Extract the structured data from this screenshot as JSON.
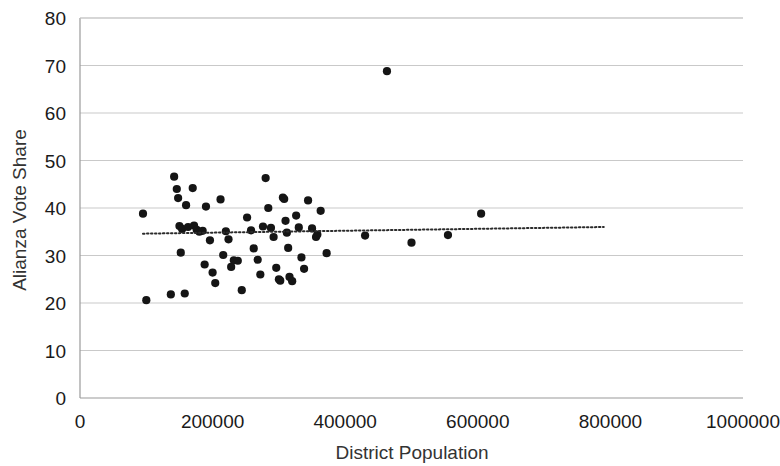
{
  "chart_data": {
    "type": "scatter",
    "title": "",
    "xlabel": "District Population",
    "ylabel": "Alianza Vote Share",
    "xlim": [
      0,
      1000000
    ],
    "ylim": [
      0,
      80
    ],
    "xticks": [
      0,
      200000,
      400000,
      600000,
      800000,
      1000000
    ],
    "xtick_labels": [
      "0",
      "200000",
      "400000",
      "600000",
      "800000",
      "1000000"
    ],
    "yticks": [
      0,
      10,
      20,
      30,
      40,
      50,
      60,
      70,
      80
    ],
    "ytick_labels": [
      "0",
      "10",
      "20",
      "30",
      "40",
      "50",
      "60",
      "70",
      "80"
    ],
    "grid": "horizontal",
    "legend": "none",
    "point_color": "#151515",
    "gridline_color": "#c9c9c9",
    "trendline": {
      "style": "dotted",
      "color": "#2b2b2b",
      "x_start": 95000,
      "y_start": 34.6,
      "x_end": 790000,
      "y_end": 36.0
    },
    "series": [
      {
        "name": "Districts",
        "points": [
          [
            95000,
            38.8
          ],
          [
            100000,
            20.6
          ],
          [
            137000,
            21.8
          ],
          [
            142000,
            46.6
          ],
          [
            146000,
            44.0
          ],
          [
            148000,
            42.1
          ],
          [
            150000,
            36.2
          ],
          [
            152000,
            30.6
          ],
          [
            154000,
            35.6
          ],
          [
            158000,
            22.0
          ],
          [
            160000,
            40.6
          ],
          [
            163000,
            36.0
          ],
          [
            170000,
            44.2
          ],
          [
            172000,
            36.3
          ],
          [
            176000,
            35.4
          ],
          [
            180000,
            35.0
          ],
          [
            185000,
            35.2
          ],
          [
            188000,
            28.1
          ],
          [
            190000,
            40.3
          ],
          [
            196000,
            33.2
          ],
          [
            200000,
            26.4
          ],
          [
            204000,
            24.2
          ],
          [
            212000,
            41.8
          ],
          [
            216000,
            30.1
          ],
          [
            220000,
            35.1
          ],
          [
            224000,
            33.4
          ],
          [
            228000,
            27.6
          ],
          [
            232000,
            29.0
          ],
          [
            238000,
            28.9
          ],
          [
            244000,
            22.7
          ],
          [
            252000,
            38.0
          ],
          [
            258000,
            35.3
          ],
          [
            262000,
            31.5
          ],
          [
            268000,
            29.1
          ],
          [
            272000,
            26.0
          ],
          [
            276000,
            36.1
          ],
          [
            280000,
            46.3
          ],
          [
            284000,
            40.0
          ],
          [
            288000,
            35.8
          ],
          [
            292000,
            33.9
          ],
          [
            296000,
            27.4
          ],
          [
            300000,
            25.0
          ],
          [
            302000,
            24.7
          ],
          [
            306000,
            42.2
          ],
          [
            308000,
            41.9
          ],
          [
            310000,
            37.3
          ],
          [
            312000,
            34.8
          ],
          [
            314000,
            31.6
          ],
          [
            316000,
            25.5
          ],
          [
            320000,
            24.6
          ],
          [
            326000,
            38.4
          ],
          [
            330000,
            35.9
          ],
          [
            334000,
            29.6
          ],
          [
            338000,
            27.2
          ],
          [
            344000,
            41.6
          ],
          [
            350000,
            35.7
          ],
          [
            356000,
            33.9
          ],
          [
            358000,
            34.4
          ],
          [
            363000,
            39.4
          ],
          [
            372000,
            30.5
          ],
          [
            430000,
            34.2
          ],
          [
            463000,
            68.8
          ],
          [
            500000,
            32.7
          ],
          [
            555000,
            34.3
          ],
          [
            605000,
            38.8
          ]
        ]
      }
    ]
  }
}
